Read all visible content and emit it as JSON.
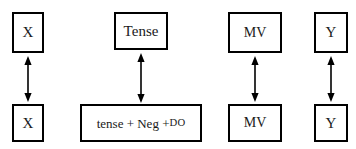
{
  "diagram": {
    "background_color": "#ffffff",
    "line_color": "#000000",
    "text_color": "#1a1a1a",
    "columns": [
      {
        "id": "column-x",
        "top_label": "X",
        "bottom_label": "X"
      },
      {
        "id": "column-tense",
        "top_label": "Tense",
        "bottom_label_part1": "tense + Neg + ",
        "bottom_label_part2": "DO"
      },
      {
        "id": "column-mv",
        "top_label": "MV",
        "bottom_label": "MV"
      },
      {
        "id": "column-y",
        "top_label": "Y",
        "bottom_label": "Y"
      }
    ],
    "arrows": {
      "icon": "double-headed-vertical-arrow",
      "count": 4
    }
  }
}
